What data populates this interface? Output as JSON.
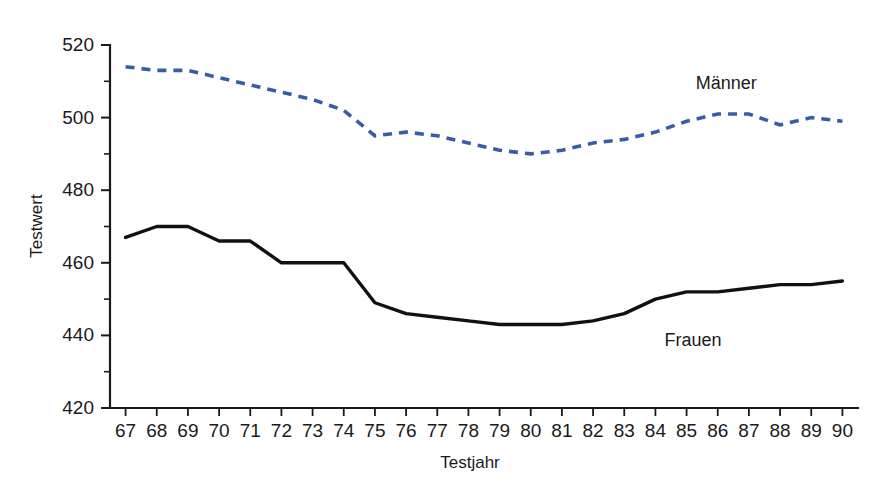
{
  "chart_data": {
    "type": "line",
    "title": "",
    "xlabel": "Testjahr",
    "ylabel": "Testwert",
    "grid": false,
    "legend_position": "inline-annotation",
    "x": [
      "67",
      "68",
      "69",
      "70",
      "71",
      "72",
      "73",
      "74",
      "75",
      "76",
      "77",
      "78",
      "79",
      "80",
      "81",
      "82",
      "83",
      "84",
      "85",
      "86",
      "87",
      "88",
      "89",
      "90"
    ],
    "xlim": [
      66.5,
      90.5
    ],
    "ylim": [
      420,
      520
    ],
    "y_ticks_major": [
      420,
      440,
      460,
      480,
      500,
      520
    ],
    "y_ticks_minor": [
      430,
      450,
      470,
      490,
      510
    ],
    "series": [
      {
        "name": "Männer",
        "color": "#3a5ba8",
        "style": "dashed",
        "label_x": "86",
        "label_value": 508,
        "values": [
          514,
          513,
          513,
          511,
          509,
          507,
          505,
          502,
          495,
          496,
          495,
          493,
          491,
          490,
          491,
          493,
          494,
          496,
          499,
          501,
          501,
          498,
          500,
          499
        ]
      },
      {
        "name": "Frauen",
        "color": "#111111",
        "style": "solid",
        "label_x": "85",
        "label_value": 437,
        "values": [
          467,
          470,
          470,
          466,
          466,
          460,
          460,
          460,
          449,
          446,
          445,
          444,
          443,
          443,
          443,
          444,
          446,
          450,
          452,
          452,
          453,
          454,
          454,
          455
        ]
      }
    ]
  },
  "axis": {
    "y_title": "Testwert",
    "x_title": "Testjahr",
    "y_tick_labels": [
      "520",
      "500",
      "480",
      "460",
      "440",
      "420"
    ],
    "x_tick_labels": [
      "67",
      "68",
      "69",
      "70",
      "71",
      "72",
      "73",
      "74",
      "75",
      "76",
      "77",
      "78",
      "79",
      "80",
      "81",
      "82",
      "83",
      "84",
      "85",
      "86",
      "87",
      "88",
      "89",
      "90"
    ]
  },
  "annotations": {
    "maenner": "Männer",
    "frauen": "Frauen"
  },
  "colors": {
    "maenner": "#3a5ba8",
    "frauen": "#111111",
    "axis": "#1a1a1a",
    "background": "#ffffff"
  }
}
